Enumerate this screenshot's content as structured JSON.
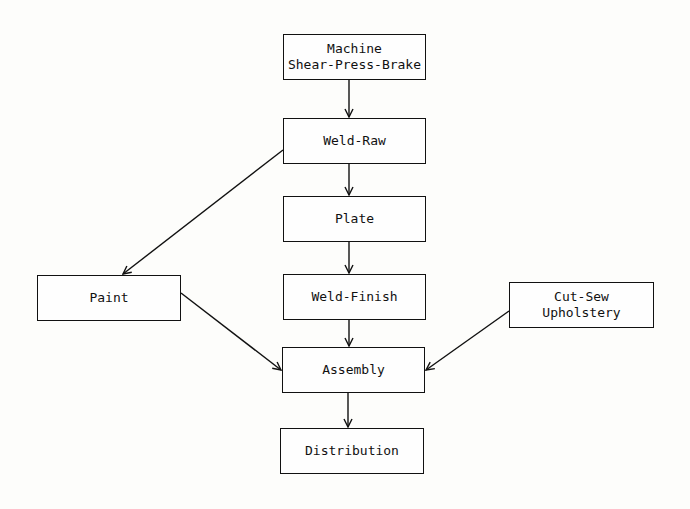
{
  "diagram": {
    "type": "flowchart",
    "nodes": [
      {
        "id": "machine",
        "lines": [
          "Machine",
          "Shear-Press-Brake"
        ]
      },
      {
        "id": "weld_raw",
        "lines": [
          "Weld-Raw"
        ]
      },
      {
        "id": "plate",
        "lines": [
          "Plate"
        ]
      },
      {
        "id": "weld_finish",
        "lines": [
          "Weld-Finish"
        ]
      },
      {
        "id": "paint",
        "lines": [
          "Paint"
        ]
      },
      {
        "id": "cut_sew",
        "lines": [
          "Cut-Sew",
          "Upholstery"
        ]
      },
      {
        "id": "assembly",
        "lines": [
          "Assembly"
        ]
      },
      {
        "id": "distribution",
        "lines": [
          "Distribution"
        ]
      }
    ],
    "edges": [
      {
        "from": "machine",
        "to": "weld_raw"
      },
      {
        "from": "weld_raw",
        "to": "plate"
      },
      {
        "from": "weld_raw",
        "to": "paint"
      },
      {
        "from": "plate",
        "to": "weld_finish"
      },
      {
        "from": "weld_finish",
        "to": "assembly"
      },
      {
        "from": "paint",
        "to": "assembly"
      },
      {
        "from": "cut_sew",
        "to": "assembly"
      },
      {
        "from": "assembly",
        "to": "distribution"
      }
    ]
  }
}
